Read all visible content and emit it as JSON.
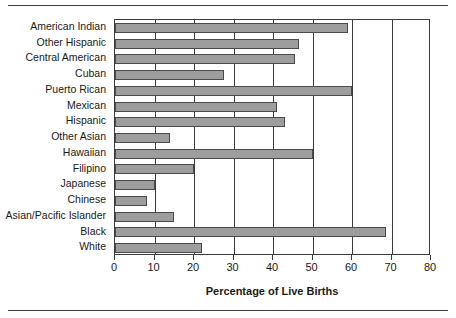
{
  "chart_data": {
    "type": "bar",
    "orientation": "horizontal",
    "title": "",
    "xlabel": "Percentage of Live Births",
    "ylabel": "",
    "xlim": [
      0,
      80
    ],
    "xticks": [
      0,
      10,
      20,
      30,
      40,
      50,
      60,
      70,
      80
    ],
    "xtick_labels": [
      "0",
      "10",
      "20",
      "30",
      "40",
      "50",
      "60",
      "70",
      "80"
    ],
    "grid": "vertical",
    "legend": "none",
    "bar_color": "#9d9d9d",
    "bar_edge_color": "#4a4a4a",
    "axis_color": "#3c3c3c",
    "categories": [
      "American Indian",
      "Other Hispanic",
      "Central American",
      "Cuban",
      "Puerto Rican",
      "Mexican",
      "Hispanic",
      "Other Asian",
      "Hawaiian",
      "Filipino",
      "Japanese",
      "Chinese",
      "Asian/Pacific Islander",
      "Black",
      "White"
    ],
    "values": [
      59,
      46.5,
      45.5,
      27.5,
      60,
      41,
      43,
      14,
      50,
      20,
      10,
      8,
      15,
      68.5,
      22
    ]
  }
}
